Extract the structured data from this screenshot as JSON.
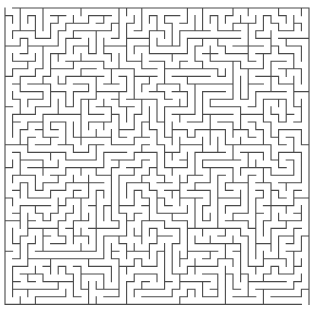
{
  "maze": {
    "cols": 40,
    "rows": 39,
    "origin_x": 5,
    "origin_y": 8,
    "cell_w": 7.6,
    "cell_h": 7.6,
    "wall_color": "#4a4a4a",
    "wall_width": 1.1,
    "background": "#ffffff",
    "entrance": {
      "side": "top",
      "col": 0
    },
    "exit": {
      "side": "bottom",
      "col": 39
    },
    "seed": 20240611
  }
}
